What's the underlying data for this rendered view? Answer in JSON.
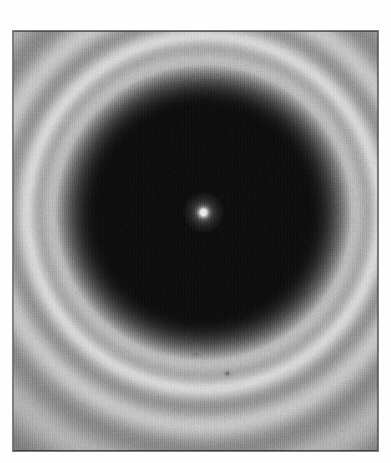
{
  "figure": {
    "kind": "scanned-diffraction-plate",
    "background_color": "#ffffff",
    "frame": {
      "x": 13,
      "y": 31,
      "width": 365,
      "height": 420,
      "border_color": "#7d7d7d"
    }
  },
  "chart_data": {
    "type": "heatmap",
    "title": "",
    "subtitle": "",
    "xlabel": "",
    "ylabel": "",
    "grid": false,
    "legend": null,
    "colormap": "grayscale",
    "value_range": [
      0,
      255
    ],
    "pattern": {
      "center_x": 190,
      "center_y": 181,
      "dark_disk_radius": 148,
      "fringe_count": 9,
      "fringe_base_period": 26,
      "fringe_period_decay": 0.82,
      "core_level": 14,
      "halo_level": 196,
      "fringe_contrast": 34
    },
    "point_sources": [
      {
        "name": "central-bright-spot",
        "x": 190,
        "y": 181,
        "radius": 3.4,
        "peak": 232,
        "halo_radius": 9
      },
      {
        "name": "faint-speck-lower-left",
        "x": 182,
        "y": 322,
        "radius": 1.3,
        "peak": 120,
        "halo_radius": 3
      },
      {
        "name": "faint-speck-lower-right",
        "x": 214,
        "y": 342,
        "radius": 1.2,
        "peak": 112,
        "halo_radius": 3
      }
    ],
    "noise": {
      "grain_amplitude": 11,
      "scanline_amplitude": 6,
      "seed": 20240417
    },
    "axis_ranges": {
      "x": [
        0,
        365
      ],
      "y": [
        0,
        420
      ]
    }
  },
  "labels": {
    "caption": "",
    "figure_number": ""
  }
}
